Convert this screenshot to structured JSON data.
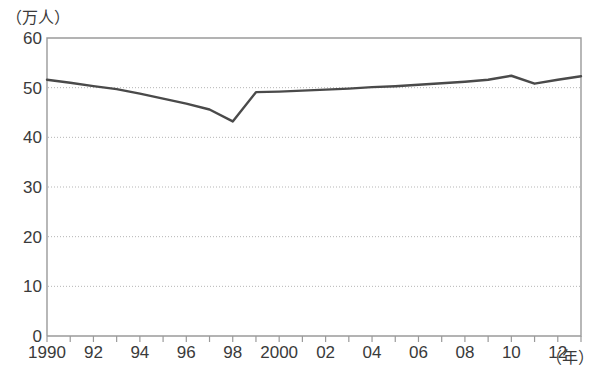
{
  "chart_data": {
    "type": "line",
    "title": "",
    "subtitle": "",
    "xlabel": "（年）",
    "ylabel": "（万人）",
    "ylim": [
      0,
      60
    ],
    "ytick_values": [
      0,
      10,
      20,
      30,
      40,
      50,
      60
    ],
    "ytick_labels": [
      "0",
      "10",
      "20",
      "30",
      "40",
      "50",
      "60"
    ],
    "grid": "horizontal-dotted",
    "legend": "none",
    "xlim": [
      1990,
      2013
    ],
    "x": [
      1990,
      1991,
      1992,
      1993,
      1994,
      1995,
      1996,
      1997,
      1998,
      1999,
      2000,
      2001,
      2002,
      2003,
      2004,
      2005,
      2006,
      2007,
      2008,
      2009,
      2010,
      2011,
      2012,
      2013
    ],
    "xtick_values": [
      1990,
      1992,
      1994,
      1996,
      1998,
      2000,
      2002,
      2004,
      2006,
      2008,
      2010,
      2012
    ],
    "xtick_labels": [
      "1990",
      "92",
      "94",
      "96",
      "98",
      "2000",
      "02",
      "04",
      "06",
      "08",
      "10",
      "12"
    ],
    "series": [
      {
        "name": "人数",
        "color": "#4a4a4a",
        "values": [
          51.6,
          51.0,
          50.3,
          49.7,
          48.8,
          47.8,
          46.8,
          45.6,
          43.2,
          49.1,
          49.2,
          49.4,
          49.6,
          49.8,
          50.1,
          50.3,
          50.6,
          50.9,
          51.2,
          51.6,
          52.4,
          50.8,
          51.6,
          52.3
        ]
      }
    ],
    "axis_color": "#9a9a9a",
    "grid_color": "#b5b5b5",
    "text_color": "#3a3a3a"
  },
  "plot_geometry": {
    "left": 47,
    "right": 581,
    "top": 38,
    "bottom": 336
  }
}
